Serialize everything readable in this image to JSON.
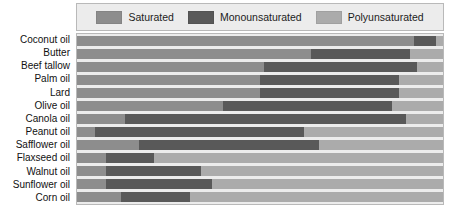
{
  "legend": {
    "entries": [
      {
        "label": "Saturated",
        "key": "saturated",
        "color": "#8d8d8d"
      },
      {
        "label": "Monounsaturated",
        "key": "monounsaturated",
        "color": "#595959"
      },
      {
        "label": "Polyunsaturated",
        "key": "polyunsaturated",
        "color": "#ababab"
      }
    ]
  },
  "chart_data": {
    "type": "bar",
    "orientation": "horizontal",
    "stacked": true,
    "title": "",
    "subtitle": "",
    "xlabel": "",
    "ylabel": "",
    "xlim": [
      0,
      100
    ],
    "xticks": [],
    "grid": false,
    "legend_position": "top",
    "categories": [
      "Coconut oil",
      "Butter",
      "Beef tallow",
      "Palm oil",
      "Lard",
      "Olive oil",
      "Canola oil",
      "Peanut oil",
      "Safflower oil",
      "Flaxseed oil",
      "Walnut oil",
      "Sunflower oil",
      "Corn oil"
    ],
    "series": [
      {
        "name": "Saturated",
        "color": "#8d8d8d",
        "values": [
          92,
          64,
          51,
          50,
          50,
          40,
          13,
          5,
          17,
          8,
          8,
          8,
          12
        ]
      },
      {
        "name": "Monounsaturated",
        "color": "#595959",
        "values": [
          6,
          27,
          42,
          38,
          38,
          46,
          77,
          57,
          49,
          13,
          26,
          29,
          19
        ]
      },
      {
        "name": "Polyunsaturated",
        "color": "#ababab",
        "values": [
          2,
          9,
          7,
          12,
          12,
          14,
          10,
          38,
          34,
          79,
          66,
          63,
          69
        ]
      }
    ]
  }
}
